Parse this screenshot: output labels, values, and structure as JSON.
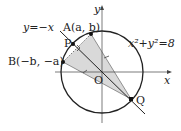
{
  "diagram": {
    "type": "coordinate-geometry",
    "axes": {
      "x_label": "x",
      "y_label": "y",
      "origin_label": "O"
    },
    "circle": {
      "equation": "x²+y²=8",
      "center": "O"
    },
    "line": {
      "equation": "y=−x"
    },
    "points": {
      "A": "A(a, b)",
      "B": "B(−b, −a)",
      "P": "P",
      "Q": "Q"
    },
    "colors": {
      "stroke": "#222222",
      "shade": "#d9d9d9"
    }
  }
}
